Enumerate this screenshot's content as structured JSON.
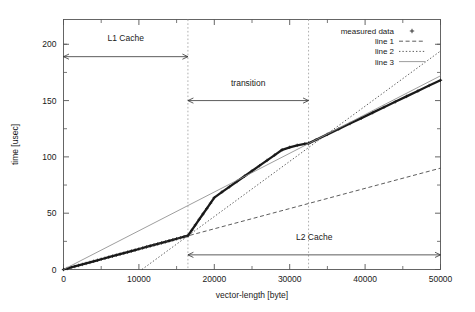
{
  "chart_data": {
    "type": "line",
    "title": "",
    "subtitle": "",
    "xlabel": "vector-length [byte]",
    "ylabel": "time [usec]",
    "xlim": [
      0,
      50000
    ],
    "ylim": [
      0,
      222
    ],
    "grid": false,
    "xticks": [
      0,
      10000,
      20000,
      30000,
      40000,
      50000
    ],
    "xtick_labels": [
      "0",
      "10000",
      "20000",
      "30000",
      "40000",
      "50000"
    ],
    "yticks": [
      0,
      50,
      100,
      150,
      200
    ],
    "ytick_labels": [
      "0",
      "50",
      "100",
      "150",
      "200"
    ],
    "minor_xticks": [
      5000,
      15000,
      25000,
      35000,
      45000
    ],
    "minor_yticks": [
      25,
      75,
      125,
      175,
      200
    ],
    "legend_position": "top-right",
    "series": [
      {
        "name": "measured data",
        "style": "points-plus",
        "marker": "+",
        "color": "#1a1a1a",
        "x": [
          0,
          500,
          1000,
          1500,
          2000,
          2500,
          3000,
          3500,
          4000,
          4500,
          5000,
          5500,
          6000,
          6500,
          7000,
          7500,
          8000,
          8500,
          9000,
          9500,
          10000,
          10500,
          11000,
          11500,
          12000,
          12500,
          13000,
          13500,
          14000,
          14500,
          15000,
          15500,
          16000,
          16500,
          17000,
          17500,
          18000,
          18500,
          19000,
          19500,
          20000,
          21000,
          22000,
          23000,
          24000,
          25000,
          26000,
          27000,
          28000,
          29000,
          30000,
          31000,
          32000,
          32500,
          33500,
          35000,
          36500,
          38000,
          39500,
          41000,
          42500,
          44000,
          45500,
          47000,
          48500,
          50000
        ],
        "y": [
          0,
          0.9,
          1.8,
          2.7,
          3.6,
          4.5,
          5.4,
          6.3,
          7.3,
          8.2,
          9.1,
          10.0,
          10.9,
          11.8,
          12.7,
          13.6,
          14.5,
          15.4,
          16.4,
          17.3,
          18.2,
          19.1,
          20.0,
          20.9,
          21.8,
          22.7,
          23.6,
          24.5,
          25.5,
          26.4,
          27.3,
          28.2,
          29.1,
          30.0,
          34.8,
          39.6,
          44.5,
          49.3,
          54.1,
          58.9,
          63.8,
          68.7,
          73.4,
          78.1,
          82.8,
          87.5,
          92.2,
          96.9,
          101.6,
          106.3,
          108.5,
          110.3,
          111.5,
          112.0,
          115.2,
          120.0,
          124.8,
          129.6,
          134.4,
          139.3,
          144.1,
          148.9,
          153.7,
          158.5,
          163.4,
          168.0
        ]
      },
      {
        "name": "line 1",
        "style": "dashed",
        "color": "#333333",
        "x": [
          10000,
          50000
        ],
        "y": [
          18.2,
          90.0
        ]
      },
      {
        "name": "line 2",
        "style": "dotted",
        "color": "#333333",
        "x": [
          10400,
          50000
        ],
        "y": [
          0.0,
          194.0
        ]
      },
      {
        "name": "line 3",
        "style": "solid",
        "color": "#8c8c8c",
        "x": [
          0,
          50000
        ],
        "y": [
          0.0,
          172.0
        ]
      }
    ],
    "annotations": [
      {
        "label": "L1 Cache",
        "type": "span-arrow",
        "x_start": 0,
        "x_end": 16500,
        "y": 189,
        "label_y": 203
      },
      {
        "label": "transition",
        "type": "span-arrow",
        "x_start": 16500,
        "x_end": 32500,
        "y": 150,
        "label_y": 163
      },
      {
        "label": "L2 Cache",
        "type": "span-arrow",
        "x_start": 16500,
        "x_end": 50000,
        "y": 13,
        "label_y": 26
      }
    ],
    "dividers": [
      {
        "x": 16500,
        "style": "dotted"
      },
      {
        "x": 32500,
        "style": "dotted"
      }
    ]
  }
}
